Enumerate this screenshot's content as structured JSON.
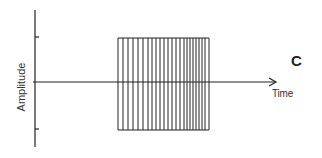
{
  "diagram": {
    "panel_label": "C",
    "x_axis_label": "Time",
    "y_axis_label": "Amplitude",
    "colors": {
      "line": "#222222",
      "background": "#ffffff"
    },
    "y_axis": {
      "x": 35,
      "y_top": 10,
      "y_bottom": 147,
      "ticks_y": [
        37,
        129
      ]
    },
    "x_axis": {
      "y": 82,
      "x_start": 33,
      "x_end": 276,
      "arrow": true
    },
    "block": {
      "x_left": 118,
      "x_right": 209,
      "y_top": 38,
      "y_bottom": 130,
      "vertical_lines_x": [
        118,
        123,
        128,
        133,
        138,
        143,
        148,
        152,
        156,
        160,
        164,
        168,
        172,
        176,
        180,
        184,
        187,
        190,
        193,
        196,
        199,
        202,
        205,
        209
      ]
    }
  }
}
